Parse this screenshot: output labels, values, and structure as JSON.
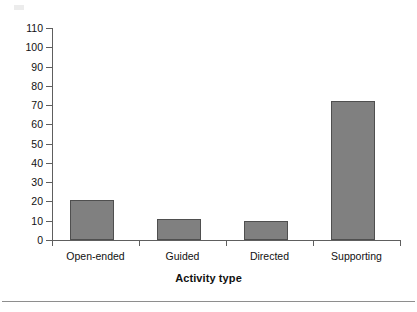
{
  "chart_data": {
    "type": "bar",
    "title": "",
    "xlabel": "Activity type",
    "ylabel": "",
    "categories": [
      "Open-ended",
      "Guided",
      "Directed",
      "Supporting"
    ],
    "values": [
      21,
      11,
      10,
      72
    ],
    "ylim": [
      0,
      110
    ],
    "ytick_values": [
      0,
      10,
      20,
      30,
      40,
      50,
      60,
      70,
      80,
      90,
      100,
      110
    ],
    "ytick_labels": [
      "0",
      "10",
      "20",
      "30",
      "40",
      "50",
      "60",
      "70",
      "80",
      "90",
      "100",
      "110"
    ],
    "grid": false,
    "legend": "none",
    "bar_color": "#808080",
    "bar_edge_color": "#4f4f4f",
    "axis_color": "#5e5e5e"
  },
  "figure": {
    "caption_rule": "",
    "background": "#ffffff"
  }
}
